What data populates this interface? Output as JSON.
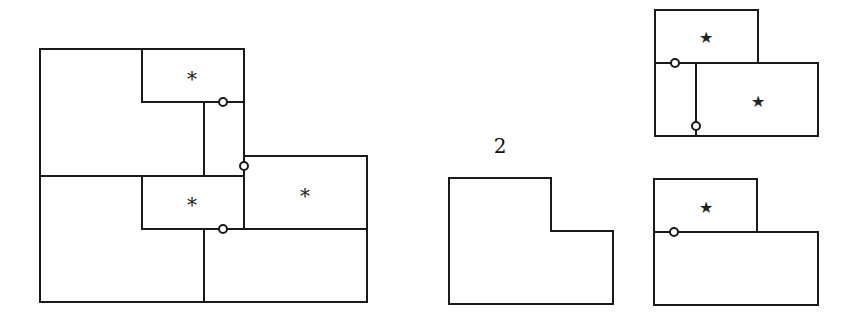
{
  "figure": {
    "left_panel": {
      "marks": [
        {
          "symbol": "*",
          "x": 192,
          "y": 79
        },
        {
          "symbol": "*",
          "x": 192,
          "y": 205
        },
        {
          "symbol": "*",
          "x": 305,
          "y": 196
        }
      ],
      "nodes": [
        {
          "x": 223,
          "y": 102
        },
        {
          "x": 244,
          "y": 166
        },
        {
          "x": 223,
          "y": 229
        }
      ]
    },
    "middle_panel": {
      "label": "2"
    },
    "right_top_panel": {
      "marks": [
        {
          "symbol": "★",
          "x": 706,
          "y": 37
        },
        {
          "symbol": "★",
          "x": 758,
          "y": 101
        }
      ],
      "nodes": [
        {
          "x": 675,
          "y": 63
        },
        {
          "x": 696,
          "y": 126
        }
      ]
    },
    "right_bottom_panel": {
      "marks": [
        {
          "symbol": "★",
          "x": 706,
          "y": 207
        }
      ],
      "nodes": [
        {
          "x": 674,
          "y": 232
        }
      ]
    },
    "colors": {
      "stroke": "#1a1a1a",
      "background": "#ffffff"
    }
  }
}
